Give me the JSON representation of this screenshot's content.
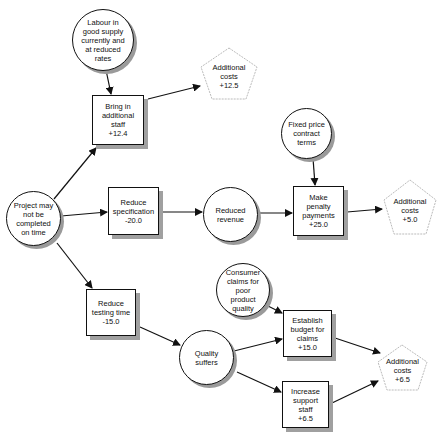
{
  "diagram": {
    "type": "influence-diagram",
    "nodes": {
      "project": {
        "shape": "circle",
        "label": "Project may\nnot be\ncompleted\non time"
      },
      "labour": {
        "shape": "circle",
        "label": "Labour in\ngood supply\ncurrently and\nat reduced\nrates"
      },
      "bring_staff": {
        "shape": "box",
        "label": "Bring in\nadditional\nstaff\n+12.4"
      },
      "cost1": {
        "shape": "pentagon",
        "label": "Additional\ncosts\n+12.5"
      },
      "reduce_spec": {
        "shape": "box",
        "label": "Reduce\nspecification\n-20.0"
      },
      "reduced_revenue": {
        "shape": "circle",
        "label": "Reduced\nrevenue"
      },
      "fixed_price": {
        "shape": "circle",
        "label": "Fixed price\ncontract\nterms"
      },
      "penalty": {
        "shape": "box",
        "label": "Make\npenalty\npayments\n+25.0"
      },
      "cost2": {
        "shape": "pentagon",
        "label": "Additional\ncosts\n+5.0"
      },
      "reduce_testing": {
        "shape": "box",
        "label": "Reduce\ntesting time\n-15.0"
      },
      "quality": {
        "shape": "circle",
        "label": "Quality\nsuffers"
      },
      "consumer_claims": {
        "shape": "circle",
        "label": "Consumer\nclaims for\npoor\nproduct\nquality"
      },
      "budget_claims": {
        "shape": "box",
        "label": "Establish\nbudget for\nclaims\n+15.0"
      },
      "support_staff": {
        "shape": "box",
        "label": "Increase\nsupport\nstaff\n+6.5"
      },
      "cost3": {
        "shape": "pentagon",
        "label": "Additional\ncosts\n+6.5"
      }
    },
    "edges": [
      [
        "labour",
        "bring_staff"
      ],
      [
        "project",
        "bring_staff"
      ],
      [
        "bring_staff",
        "cost1"
      ],
      [
        "project",
        "reduce_spec"
      ],
      [
        "reduce_spec",
        "reduced_revenue"
      ],
      [
        "reduced_revenue",
        "penalty"
      ],
      [
        "fixed_price",
        "penalty"
      ],
      [
        "penalty",
        "cost2"
      ],
      [
        "project",
        "reduce_testing"
      ],
      [
        "reduce_testing",
        "quality"
      ],
      [
        "quality",
        "budget_claims"
      ],
      [
        "consumer_claims",
        "budget_claims"
      ],
      [
        "quality",
        "support_staff"
      ],
      [
        "budget_claims",
        "cost3"
      ],
      [
        "support_staff",
        "cost3"
      ]
    ]
  }
}
